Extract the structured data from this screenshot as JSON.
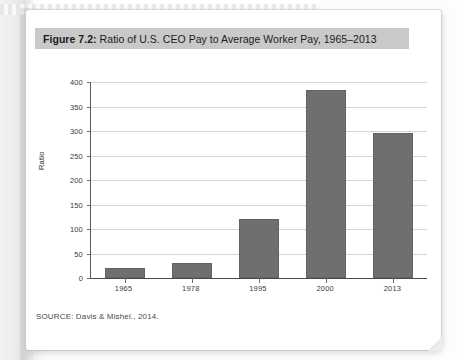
{
  "figure": {
    "label": "Figure 7.2:",
    "caption": " Ratio of U.S. CEO Pay to Average Worker Pay, 1965–2013",
    "source_note": "SOURCE: Davis & Mishel., 2014."
  },
  "colors": {
    "bar_fill": "#6f6f6f",
    "title_band": "#c9c9c9",
    "gridline": "#d5d5d5",
    "axis": "#4a4a4a",
    "page": "#ffffff"
  },
  "chart_data": {
    "type": "bar",
    "title": "Figure 7.2: Ratio of U.S. CEO Pay to Average Worker Pay, 1965–2013",
    "xlabel": "",
    "ylabel": "Ratio",
    "categories": [
      "1965",
      "1978",
      "1995",
      "2000",
      "2013"
    ],
    "values": [
      20,
      30,
      120,
      383,
      295
    ],
    "ylim": [
      0,
      400
    ],
    "ytick_labels": [
      "0",
      "50",
      "100",
      "150",
      "200",
      "250",
      "300",
      "350",
      "400"
    ],
    "ytick_values": [
      0,
      50,
      100,
      150,
      200,
      250,
      300,
      350,
      400
    ],
    "grid": true,
    "legend": false,
    "legend_position": "none"
  }
}
